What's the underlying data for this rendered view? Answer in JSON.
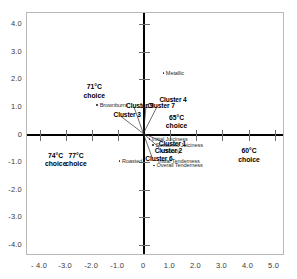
{
  "chart_data": {
    "type": "scatter",
    "title": "",
    "xlabel": "",
    "ylabel": "",
    "xlim": [
      -4.5,
      5.4
    ],
    "ylim": [
      -4.4,
      4.4
    ],
    "grid": false,
    "legend": "none",
    "xticks": [
      "- 4.0",
      "-3.0",
      "-2.0",
      "-1.0",
      "0",
      "1.0",
      "2.0",
      "3.0",
      "4.0",
      "5.0"
    ],
    "xtick_values": [
      -4,
      -3,
      -2,
      -1,
      0,
      1,
      2,
      3,
      4,
      5
    ],
    "yticks": [
      "4.0",
      "3.0",
      "2.0",
      "1.0",
      "0",
      "-1.0",
      "-2.0",
      "-3.0",
      "-4.0"
    ],
    "ytick_values": [
      4,
      3,
      2,
      1,
      0,
      -1,
      -2,
      -3,
      -4
    ],
    "attributes": [
      {
        "name": "Metallic",
        "x": 0.82,
        "y": 2.22
      },
      {
        "name": "Brownburnt",
        "x": -1.72,
        "y": 1.06
      },
      {
        "name": "Roasted",
        "x": -0.86,
        "y": -0.98
      },
      {
        "name": "Initial Juiciness",
        "x": 0.28,
        "y": -0.18
      },
      {
        "name": "Sustained Juiciness",
        "x": 0.42,
        "y": -0.4
      },
      {
        "name": "Bloody",
        "x": 0.74,
        "y": -0.62
      },
      {
        "name": "Initial Tenderness",
        "x": 0.52,
        "y": -0.96
      },
      {
        "name": "Overall Tenderness",
        "x": 0.46,
        "y": -1.14
      }
    ],
    "clusters": [
      {
        "name": "Cluster 3",
        "x": -0.86,
        "y": 0.62,
        "label_x": -1.18,
        "label_y": 0.72
      },
      {
        "name": "Cluster 9",
        "x": -0.36,
        "y": 0.96,
        "label_x": -0.7,
        "label_y": 1.02
      },
      {
        "name": "Cluster 7",
        "x": 0.1,
        "y": 0.98,
        "label_x": 0.12,
        "label_y": 1.02
      },
      {
        "name": "Cluster 4",
        "x": 0.54,
        "y": 1.0,
        "label_x": 0.58,
        "label_y": 1.26
      },
      {
        "name": "Cluster 1",
        "x": 0.7,
        "y": -0.28,
        "label_x": 0.56,
        "label_y": -0.34
      },
      {
        "name": "Cluster 2",
        "x": 0.62,
        "y": -0.52,
        "label_x": 0.4,
        "label_y": -0.58
      },
      {
        "name": "Cluster 6",
        "x": 0.34,
        "y": -0.88,
        "label_x": 0.04,
        "label_y": -0.88
      }
    ],
    "choice_groups": [
      {
        "label_line1": "71°C",
        "label_line2": "choice",
        "x": -1.92,
        "y": 1.56
      },
      {
        "label_line1": "65°C",
        "label_line2": "choice",
        "x": 1.24,
        "y": 0.46
      },
      {
        "label_line1": "60°C",
        "label_line2": "choice",
        "x": 4.02,
        "y": -0.76
      },
      {
        "label_line1": "74°C",
        "label_line2": "choice",
        "x": -3.4,
        "y": -0.92
      },
      {
        "label_line1": "77°C",
        "label_line2": "choice",
        "x": -2.62,
        "y": -0.92
      }
    ]
  },
  "colors": {
    "axis": "#000000",
    "tick": "#6d6d6d",
    "frame": "#b9b9b9",
    "text": "#1a1a1a",
    "point": "#2e2e2e"
  }
}
